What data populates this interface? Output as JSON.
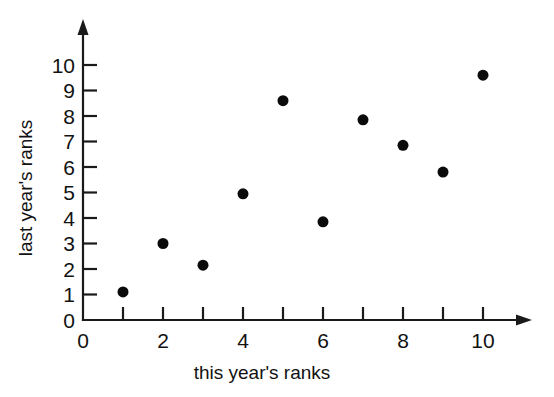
{
  "chart_data": {
    "type": "scatter",
    "title": "",
    "xlabel": "this year's ranks",
    "ylabel": "last year's ranks",
    "xlim": [
      0,
      11.2
    ],
    "ylim": [
      0,
      10.9
    ],
    "grid": false,
    "legend": "none",
    "x_ticks": [
      0,
      2,
      4,
      6,
      8,
      10
    ],
    "x_tick_labels": [
      "0",
      "2",
      "4",
      "6",
      "8",
      "10"
    ],
    "x_minor_ticks": [
      1,
      3,
      5,
      7,
      9
    ],
    "y_ticks": [
      0,
      1,
      2,
      3,
      4,
      5,
      6,
      7,
      8,
      9,
      10
    ],
    "y_tick_labels": [
      "0",
      "1",
      "2",
      "3",
      "4",
      "5",
      "6",
      "7",
      "8",
      "9",
      "10"
    ],
    "marker": "filled-circle",
    "marker_color": "#0a0a0a",
    "marker_size_px": 11,
    "axis_color": "#1a1a1a",
    "axis_style": "arrow-terminated",
    "background": "#ffffff",
    "x": [
      1,
      2,
      3,
      4,
      5,
      6,
      7,
      8,
      9,
      10
    ],
    "y": [
      1.1,
      3.0,
      2.15,
      4.95,
      8.6,
      3.85,
      7.85,
      6.85,
      5.8,
      9.6
    ],
    "points": [
      {
        "x": 1,
        "y": 1.1
      },
      {
        "x": 2,
        "y": 3.0
      },
      {
        "x": 3,
        "y": 2.15
      },
      {
        "x": 4,
        "y": 4.95
      },
      {
        "x": 5,
        "y": 8.6
      },
      {
        "x": 6,
        "y": 3.85
      },
      {
        "x": 7,
        "y": 7.85
      },
      {
        "x": 8,
        "y": 6.85
      },
      {
        "x": 9,
        "y": 5.8
      },
      {
        "x": 10,
        "y": 9.6
      }
    ]
  },
  "axes": {
    "x_label": "this year's ranks",
    "y_label": "last year's ranks"
  },
  "y_tick_labels": {
    "t0": "0",
    "t1": "1",
    "t2": "2",
    "t3": "3",
    "t4": "4",
    "t5": "5",
    "t6": "6",
    "t7": "7",
    "t8": "8",
    "t9": "9",
    "t10": "10"
  },
  "x_tick_labels": {
    "t0": "0",
    "t2": "2",
    "t4": "4",
    "t6": "6",
    "t8": "8",
    "t10": "10"
  }
}
